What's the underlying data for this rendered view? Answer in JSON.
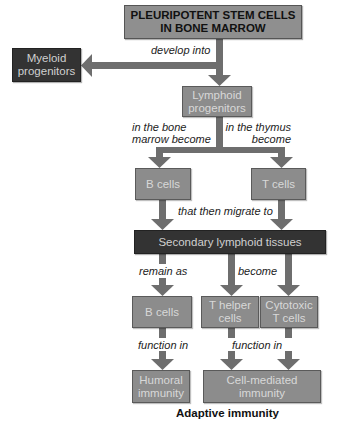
{
  "colors": {
    "box_fill": "#8c8c8c",
    "box_border": "#5a5a5a",
    "dark_box_fill": "#333333",
    "arrow": "#6e6e6e",
    "text_light": "#d8d8d8",
    "text_dark": "#111111"
  },
  "nodes": {
    "stem_cells": {
      "line1": "PLEURIPOTENT STEM CELLS",
      "line2": "IN BONE MARROW"
    },
    "myeloid": {
      "line1": "Myeloid",
      "line2": "progenitors"
    },
    "lymphoid": {
      "line1": "Lymphoid",
      "line2": "progenitors"
    },
    "b_cells_1": {
      "label": "B cells"
    },
    "t_cells": {
      "label": "T cells"
    },
    "secondary": {
      "label": "Secondary lymphoid tissues"
    },
    "b_cells_2": {
      "label": "B cells"
    },
    "t_helper": {
      "line1": "T helper",
      "line2": "cells"
    },
    "cytotoxic": {
      "line1": "Cytotoxic",
      "line2": "T cells"
    },
    "humoral": {
      "line1": "Humoral",
      "line2": "immunity"
    },
    "cell_mediated": {
      "line1": "Cell-mediated",
      "line2": "immunity"
    }
  },
  "edge_labels": {
    "develop_into": "develop into",
    "bone_marrow_1": "in the bone",
    "bone_marrow_2": "marrow become",
    "thymus_1": "in the thymus",
    "thymus_2": "become",
    "migrate": "that then migrate to",
    "remain_as": "remain as",
    "become": "become",
    "function_in_1": "function in",
    "function_in_2": "function in"
  },
  "caption": "Adaptive immunity"
}
